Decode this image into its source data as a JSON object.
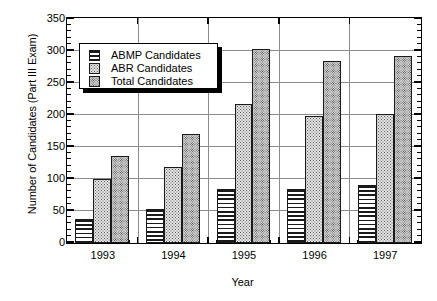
{
  "chart_data": {
    "type": "bar",
    "title": "",
    "xlabel": "Year",
    "ylabel": "Number of Candidates (Part III Exam)",
    "categories": [
      "1993",
      "1994",
      "1995",
      "1996",
      "1997"
    ],
    "series": [
      {
        "name": "ABMP Candidates",
        "values": [
          37,
          53,
          85,
          84,
          90
        ]
      },
      {
        "name": "ABR Candidates",
        "values": [
          100,
          118,
          217,
          199,
          202
        ]
      },
      {
        "name": "Total Candidates",
        "values": [
          136,
          170,
          303,
          285,
          292
        ]
      }
    ],
    "ylim": [
      0,
      350
    ],
    "yticks": [
      0,
      50,
      100,
      150,
      200,
      250,
      300,
      350
    ],
    "ytick_labels": [
      "0",
      "50",
      "100",
      "150",
      "200",
      "250",
      "300",
      "350"
    ],
    "y_minor_tick_step": 10,
    "grid": true,
    "grid_axis": "both",
    "legend_position": "upper left",
    "bar_colors": [
      "#ffffff",
      "#e6e6e6",
      "#d2d2d2"
    ],
    "bar_patterns": [
      "horizontal-lines",
      "light-stipple",
      "dense-stipple"
    ],
    "edge_color": "#1a1a1a",
    "grid_color": "#8b8b8b",
    "frame_color": "#000000"
  },
  "axes": {
    "y_title": "Number of Candidates (Part III Exam)",
    "x_title": "Year"
  },
  "legend": {
    "entries": [
      {
        "label": "ABMP Candidates"
      },
      {
        "label": "ABR Candidates"
      },
      {
        "label": "Total Candidates"
      }
    ]
  }
}
